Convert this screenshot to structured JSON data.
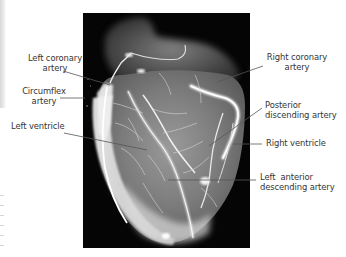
{
  "figure": {
    "labels": {
      "left_coronary": {
        "line1": "Left coronary",
        "line2": "artery"
      },
      "circumflex": {
        "line1": "Circumflex",
        "line2": "artery"
      },
      "left_ventricle": {
        "line1": "Left ventricle"
      },
      "right_coronary": {
        "line1": "Right coronary",
        "line2": "artery"
      },
      "posterior_descending": {
        "line1": "Posterior",
        "line2": "discending artery"
      },
      "right_ventricle": {
        "line1": "Right ventricle"
      },
      "left_anterior_descending": {
        "line1": "Left  anterior",
        "line2": "descending artery"
      }
    },
    "colors": {
      "background": "#ffffff",
      "xray_background": "#050505",
      "label_text": "#333333",
      "leader_line": "#555555",
      "vessel": "#f4f4f4",
      "myocardium": "#8a8a8a"
    }
  }
}
